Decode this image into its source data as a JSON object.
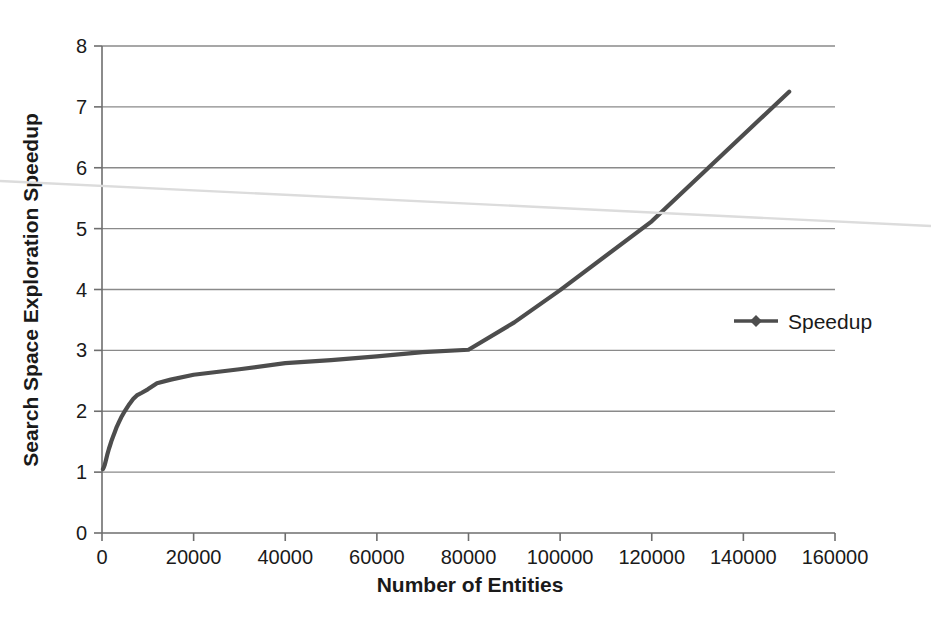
{
  "chart_data": {
    "type": "line",
    "title": "",
    "xlabel": "Number of Entities",
    "ylabel": "Search Space Exploration Speedup",
    "xlim": [
      0,
      160000
    ],
    "ylim": [
      0,
      8
    ],
    "xticks": [
      0,
      20000,
      40000,
      60000,
      80000,
      100000,
      120000,
      140000,
      160000
    ],
    "xtick_labels": [
      "0",
      "20000",
      "40000",
      "60000",
      "80000",
      "100000",
      "120000",
      "140000",
      "160000"
    ],
    "yticks": [
      0,
      1,
      2,
      3,
      4,
      5,
      6,
      7,
      8
    ],
    "ytick_labels": [
      "0",
      "1",
      "2",
      "3",
      "4",
      "5",
      "6",
      "7",
      "8"
    ],
    "grid": "horizontal",
    "legend": {
      "position": "right-middle",
      "entries": [
        "Speedup"
      ]
    },
    "marker": "diamond",
    "series": [
      {
        "name": "Speedup",
        "color": "#4d4d4d",
        "points": [
          [
            200,
            1.05
          ],
          [
            400,
            1.08
          ],
          [
            600,
            1.12
          ],
          [
            800,
            1.18
          ],
          [
            1000,
            1.24
          ],
          [
            1200,
            1.3
          ],
          [
            1500,
            1.38
          ],
          [
            1800,
            1.45
          ],
          [
            2100,
            1.52
          ],
          [
            2400,
            1.58
          ],
          [
            2800,
            1.66
          ],
          [
            3200,
            1.74
          ],
          [
            3700,
            1.82
          ],
          [
            4200,
            1.9
          ],
          [
            4800,
            1.98
          ],
          [
            5400,
            2.05
          ],
          [
            6000,
            2.12
          ],
          [
            6800,
            2.2
          ],
          [
            7600,
            2.26
          ],
          [
            8600,
            2.3
          ],
          [
            10000,
            2.36
          ],
          [
            12000,
            2.46
          ],
          [
            15000,
            2.52
          ],
          [
            20000,
            2.6
          ],
          [
            30000,
            2.69
          ],
          [
            40000,
            2.79
          ],
          [
            50000,
            2.84
          ],
          [
            60000,
            2.9
          ],
          [
            70000,
            2.97
          ],
          [
            80000,
            3.01
          ],
          [
            90000,
            3.46
          ],
          [
            100000,
            3.99
          ],
          [
            120000,
            5.12
          ],
          [
            150000,
            7.25
          ]
        ]
      }
    ]
  },
  "artifact": {
    "name": "scan-line",
    "color": "#dcdcdc"
  },
  "colors": {
    "series": "#4d4d4d",
    "grid": "#8a8a8a",
    "axis": "#6e6e6e",
    "text": "#1a1a1a",
    "background": "#ffffff"
  }
}
